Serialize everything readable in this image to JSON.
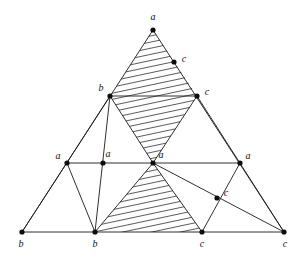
{
  "figure": {
    "canvas": {
      "width": 302,
      "height": 258
    },
    "stroke_color": "#1a1a1a",
    "dot_color": "#0d0d0d",
    "label_color": "#111111",
    "background": "#ffffff",
    "hatch": {
      "angle_deg": -12,
      "spacing_px": 6,
      "line_width": 0.8,
      "color": "#1a1a1a"
    },
    "points": {
      "a_apex": {
        "x": 153,
        "y": 30,
        "label": "a"
      },
      "c_upper": {
        "x": 174,
        "y": 62,
        "label": "c"
      },
      "b_row2_left": {
        "x": 110,
        "y": 96,
        "label": "b"
      },
      "c_row2_right": {
        "x": 197,
        "y": 96,
        "label": "c"
      },
      "a_mid_left": {
        "x": 67,
        "y": 163,
        "label": "a"
      },
      "a_mid_inner": {
        "x": 103,
        "y": 163,
        "label": "a"
      },
      "a_center": {
        "x": 153,
        "y": 163,
        "label": "a"
      },
      "a_mid_right": {
        "x": 240,
        "y": 163,
        "label": "a"
      },
      "c_lower_right": {
        "x": 217,
        "y": 198,
        "label": "c"
      },
      "b_bottom_left": {
        "x": 22,
        "y": 232,
        "label": "b"
      },
      "b_bottom_mid": {
        "x": 95,
        "y": 232,
        "label": "b"
      },
      "c_bottom_mid": {
        "x": 202,
        "y": 232,
        "label": "c"
      },
      "c_bottom_right": {
        "x": 284,
        "y": 232,
        "label": "c"
      }
    },
    "labels": [
      {
        "name": "label-a-apex",
        "text": "a",
        "x": 153,
        "y": 18
      },
      {
        "name": "label-c-upper",
        "text": "c",
        "x": 184,
        "y": 60
      },
      {
        "name": "label-b-row2-left",
        "text": "b",
        "x": 101,
        "y": 89
      },
      {
        "name": "label-c-row2-right",
        "text": "c",
        "x": 207,
        "y": 93
      },
      {
        "name": "label-a-mid-left",
        "text": "a",
        "x": 58,
        "y": 157
      },
      {
        "name": "label-a-mid-inner",
        "text": "a",
        "x": 108,
        "y": 155
      },
      {
        "name": "label-a-center",
        "text": "a",
        "x": 161,
        "y": 156
      },
      {
        "name": "label-a-mid-right",
        "text": "a",
        "x": 248,
        "y": 157
      },
      {
        "name": "label-c-lower-right",
        "text": "c",
        "x": 226,
        "y": 194
      },
      {
        "name": "label-b-bottom-left",
        "text": "b",
        "x": 21,
        "y": 245
      },
      {
        "name": "label-b-bottom-mid",
        "text": "b",
        "x": 95,
        "y": 245
      },
      {
        "name": "label-c-bottom-mid",
        "text": "c",
        "x": 202,
        "y": 245
      },
      {
        "name": "label-c-bottom-right",
        "text": "c",
        "x": 285,
        "y": 245
      }
    ],
    "edges": [
      {
        "name": "edge-outer-left",
        "from": "a_apex",
        "to": "b_bottom_left"
      },
      {
        "name": "edge-outer-right",
        "from": "a_apex",
        "to": "c_bottom_right"
      },
      {
        "name": "edge-outer-bottom",
        "from": "b_bottom_left",
        "to": "c_bottom_right"
      },
      {
        "name": "edge-row2-b-to-c",
        "from": "b_row2_left",
        "to": "c_row2_right"
      },
      {
        "name": "edge-midrow-left",
        "from": "a_mid_left",
        "to": "a_center"
      },
      {
        "name": "edge-midrow-right",
        "from": "a_center",
        "to": "a_mid_right"
      },
      {
        "name": "edge-b2-to-bbl",
        "from": "b_row2_left",
        "to": "b_bottom_left"
      },
      {
        "name": "edge-b2-to-bbm",
        "from": "b_row2_left",
        "to": "b_bottom_mid"
      },
      {
        "name": "edge-b2-to-acenter",
        "from": "b_row2_left",
        "to": "a_center"
      },
      {
        "name": "edge-c2-to-acenter",
        "from": "c_row2_right",
        "to": "a_center"
      },
      {
        "name": "edge-c2-to-cbr",
        "from": "c_row2_right",
        "to": "c_bottom_right"
      },
      {
        "name": "edge-amidleft-to-bbm",
        "from": "a_mid_left",
        "to": "b_bottom_mid"
      },
      {
        "name": "edge-acenter-to-bbm",
        "from": "a_center",
        "to": "b_bottom_mid"
      },
      {
        "name": "edge-acenter-to-cbm",
        "from": "a_center",
        "to": "c_bottom_mid"
      },
      {
        "name": "edge-acenter-to-cbr",
        "from": "a_center",
        "to": "c_bottom_right"
      },
      {
        "name": "edge-amidright-to-cbm",
        "from": "a_mid_right",
        "to": "c_bottom_mid"
      }
    ],
    "hatched_regions": [
      {
        "name": "hatched-top-triangle",
        "vertices": [
          "a_apex",
          "b_row2_left",
          "c_row2_right"
        ]
      },
      {
        "name": "hatched-middle-triangle",
        "vertices": [
          "b_row2_left",
          "c_row2_right",
          "a_center"
        ]
      },
      {
        "name": "hatched-bottom-triangle",
        "vertices": [
          "a_center",
          "b_bottom_mid",
          "c_bottom_mid"
        ]
      }
    ]
  }
}
